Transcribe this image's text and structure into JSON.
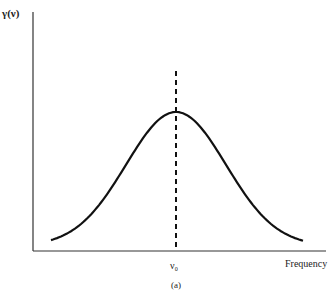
{
  "chart_data": {
    "type": "line",
    "title": "",
    "ylabel": "γ(ν)",
    "xlabel": "Frequency",
    "x_ticks": [
      "ν0"
    ],
    "caption": "(a)",
    "series": [
      {
        "name": "Gaussian line profile",
        "shape": "gaussian",
        "center": "ν0",
        "x": [
          -3,
          -2,
          -1.5,
          -1,
          -0.5,
          0,
          0.5,
          1,
          1.5,
          2,
          3
        ],
        "values": [
          0.01,
          0.14,
          0.33,
          0.61,
          0.88,
          1.0,
          0.88,
          0.61,
          0.33,
          0.14,
          0.01
        ]
      }
    ],
    "annotations": [
      {
        "type": "dashed-vertical-line",
        "x": "ν0"
      }
    ],
    "grid": false,
    "legend": "none"
  },
  "labels": {
    "y_axis": "γ(ν)",
    "x_axis": "Frequency",
    "center_tick": "ν₀",
    "caption": "(a)"
  }
}
